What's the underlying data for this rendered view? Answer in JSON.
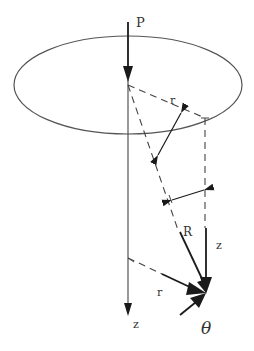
{
  "diagram": {
    "colors": {
      "line": "#444444",
      "arrow": "#1a1a1a",
      "text": "#333333",
      "background": "#ffffff"
    },
    "labels": {
      "load": "P",
      "radius_top": "r",
      "distance": "R",
      "depth": "z",
      "radius_bottom": "r",
      "axis": "z",
      "angle": "θ"
    }
  }
}
